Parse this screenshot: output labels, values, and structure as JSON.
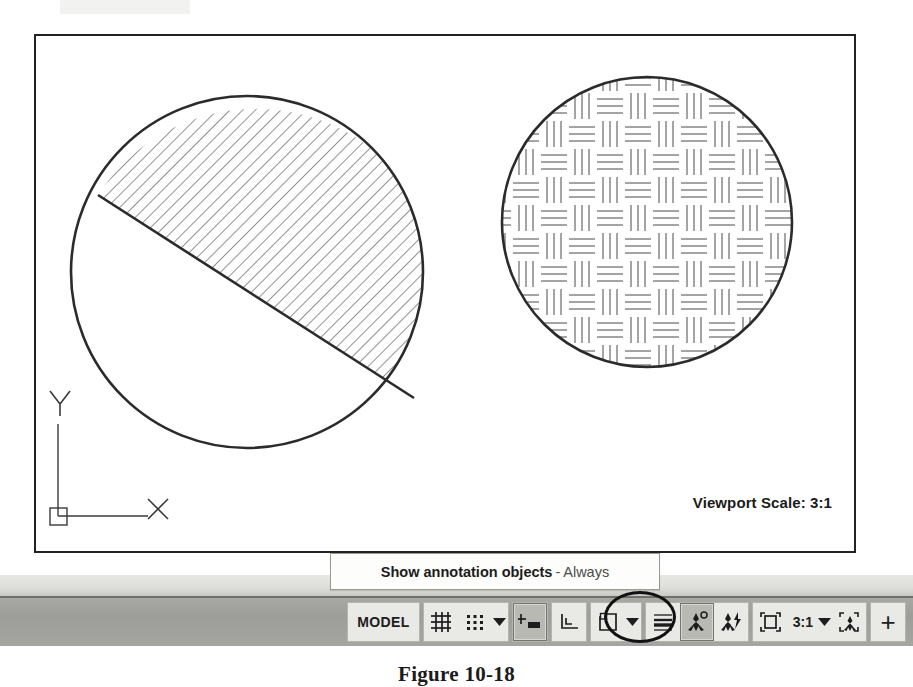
{
  "application": "AutoCAD",
  "drawing": {
    "viewport_scale_label": "Viewport Scale: 3:1",
    "ucs_icon": {
      "x_axis_label": "X",
      "y_axis_label": "Y"
    },
    "objects": [
      {
        "name": "hatched-circle-left",
        "shape": "circle",
        "center_x": 245,
        "center_y": 270,
        "radius": 176,
        "hatch_pattern": "ANSI31",
        "hatch_description": "diagonal line hatch on upper segment",
        "chord": true
      },
      {
        "name": "hatched-circle-right",
        "shape": "circle",
        "center_x": 645,
        "center_y": 220,
        "radius": 146,
        "hatch_pattern": "AR-B816 basketweave",
        "hatch_description": "basketweave parquet hatch filling circle",
        "chord": false
      }
    ]
  },
  "tooltip": {
    "title": "Show annotation objects",
    "separator": "-",
    "value": "Always"
  },
  "statusbar": {
    "space_toggle": "MODEL",
    "annotation_scale": "3:1",
    "buttons": [
      {
        "name": "model-space-toggle",
        "label": "MODEL"
      },
      {
        "name": "grid-display-toggle",
        "icon": "grid-icon"
      },
      {
        "name": "snap-mode-toggle",
        "icon": "snap-dots-icon"
      },
      {
        "name": "snap-settings-dropdown",
        "icon": "chevron-down-icon"
      },
      {
        "name": "dynamic-input-toggle",
        "icon": "dynamic-input-icon"
      },
      {
        "name": "ortho-mode-toggle",
        "icon": "ortho-icon"
      },
      {
        "name": "polar-tracking-toggle",
        "icon": "polar-tracking-icon"
      },
      {
        "name": "polar-tracking-dropdown",
        "icon": "chevron-down-icon"
      },
      {
        "name": "lineweight-display-toggle",
        "icon": "lineweight-icon"
      },
      {
        "name": "annotation-visibility-toggle",
        "icon": "annotation-visibility-icon"
      },
      {
        "name": "autoscale-annotations-toggle",
        "icon": "autoscale-annotation-icon"
      },
      {
        "name": "viewport-maximize-toggle",
        "icon": "viewport-frame-icon"
      },
      {
        "name": "annotation-scale-dropdown",
        "label": "3:1",
        "icon": "chevron-down-icon"
      },
      {
        "name": "annotation-scale-icon",
        "icon": "annotation-scale-icon"
      },
      {
        "name": "customization-button",
        "icon": "plus-icon"
      }
    ]
  },
  "caption": {
    "text": "Figure 10-18"
  },
  "colors": {
    "page_background": "#ffffff",
    "viewport_border": "#222222",
    "statusbar_background": "#a3a39f",
    "statusbar_button": "#e9e9e6",
    "statusbar_pressed": "#b9b9b4",
    "tooltip_background": "#fdfdfb",
    "tooltip_border": "#9a9a93",
    "highlight_circle": "#111111",
    "geometry_stroke": "#2b2b2b"
  }
}
